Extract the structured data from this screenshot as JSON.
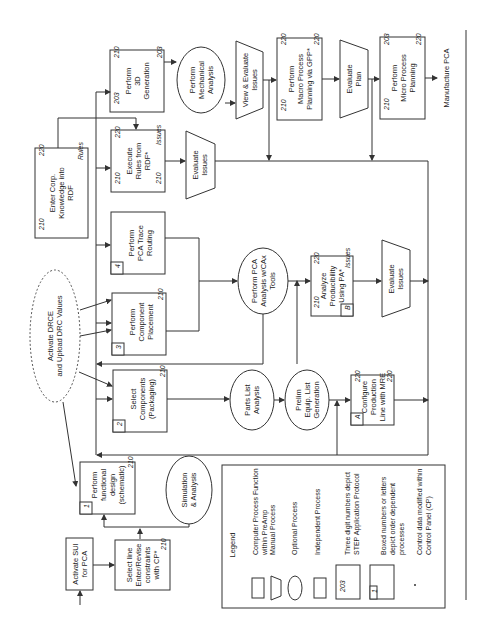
{
  "diagram": {
    "nodes": {
      "activate_sui": {
        "lines": [
          "Activate SUI",
          "for PCA"
        ]
      },
      "select_line": {
        "lines": [
          "Select line",
          "Enter/Revise",
          "constraints",
          "with CP*"
        ],
        "num": "210"
      },
      "functional_design": {
        "lines": [
          "Perform",
          "functional",
          "design",
          "(schematic)"
        ],
        "num": "210",
        "box": "1"
      },
      "simulation": {
        "lines": [
          "Simulation",
          "& Analysis"
        ]
      },
      "activate_drce": {
        "lines": [
          "Activate DRCE",
          "and Upload DRC Values"
        ]
      },
      "select_components": {
        "lines": [
          "Select",
          "Components",
          "(Packaging)"
        ],
        "num": "210",
        "box": "2"
      },
      "parts_list": {
        "lines": [
          "Parts List",
          "Analysis"
        ]
      },
      "prelim_equip": {
        "lines": [
          "Prelim",
          "Equip. List",
          "Generation"
        ]
      },
      "configure_line": {
        "lines": [
          "Configure",
          "Production",
          "Line with MRE"
        ],
        "num_top": "220",
        "num_bottom": "220",
        "box": "A"
      },
      "component_placement": {
        "lines": [
          "Perform",
          "Component",
          "Placement"
        ],
        "num": "210",
        "box": "3"
      },
      "trace_routing": {
        "lines": [
          "Perform",
          "PCA Trace",
          "Routing"
        ],
        "box": "4"
      },
      "pca_analysis": {
        "lines": [
          "Perform PCA",
          "Analysis w/CAx",
          "Tools"
        ]
      },
      "analyze_producibility": {
        "lines": [
          "Analyze",
          "Producibility",
          "Using PA*"
        ],
        "num_left": "210",
        "num_right": "220",
        "issues": "Issues",
        "box": "B"
      },
      "evaluate_issues_b": {
        "lines": [
          "Evaluate",
          "Issues"
        ]
      },
      "enter_corp": {
        "lines": [
          "Enter Corp.",
          "Knowledge into",
          "RDF"
        ],
        "num_left": "210",
        "num_right": "220",
        "rules": "Rules"
      },
      "execute_rules": {
        "lines": [
          "Execute",
          "Rules from",
          "RDF*"
        ],
        "num_tl": "210",
        "num_tr": "220",
        "num_bl": "210",
        "issues": "Issues"
      },
      "evaluate_issues_rdf": {
        "lines": [
          "Evaluate",
          "Issues"
        ]
      },
      "perform_3d": {
        "lines": [
          "Perform",
          "3D",
          "Generation"
        ],
        "num_a": "203",
        "num_b": "210",
        "num_c": "203"
      },
      "mechanical_analysis": {
        "lines": [
          "Perform",
          "Mechanical",
          "Analysis"
        ]
      },
      "view_evaluate": {
        "lines": [
          "View & Evaluate",
          "Issues"
        ]
      },
      "macro_planning": {
        "lines": [
          "Perform",
          "Macro Process",
          "Planning via GPP*"
        ],
        "num_a": "210",
        "num_b": "220",
        "num_c": "220"
      },
      "evaluate_plan": {
        "lines": [
          "Evaluate",
          "Plan"
        ]
      },
      "micro_planning": {
        "lines": [
          "Perform",
          "Micro Process",
          "Planning"
        ],
        "num_a": "210",
        "num_b": "203",
        "num_c": "220"
      },
      "manufacture": {
        "lines": [
          "Manufacture PCA"
        ]
      }
    },
    "legend": {
      "title": "Legend",
      "items": [
        {
          "shape": "rectangle",
          "label_lines": [
            "Computer Process Function",
            "within PreAmp"
          ]
        },
        {
          "shape": "trapezoid",
          "label_lines": [
            "Manual Process"
          ]
        },
        {
          "shape": "ellipse",
          "label_lines": [
            "Optional Process"
          ]
        },
        {
          "shape": "double-rectangle",
          "label_lines": [
            "Independent Process"
          ]
        },
        {
          "shape": "numbered-box",
          "sample": "203",
          "label_lines": [
            "Three digit numbers depict",
            "STEP Application Protocol"
          ]
        },
        {
          "shape": "boxed-number",
          "sample": "1",
          "label_lines": [
            "Boxed numbers or letters",
            "depict order dependent",
            "processes"
          ]
        },
        {
          "shape": "asterisk",
          "sample": "*",
          "label_lines": [
            "Control data modified within",
            "Control Panel (CP)"
          ]
        }
      ]
    }
  }
}
